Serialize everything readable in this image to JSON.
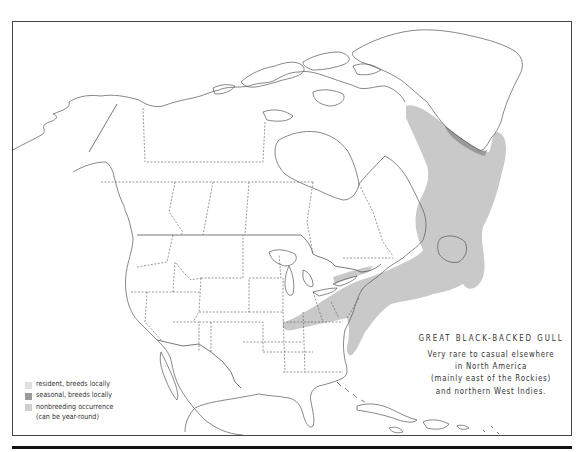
{
  "map": {
    "species_title": "GREAT BLACK-BACKED GULL",
    "note_lines": [
      "Very rare to casual elsewhere",
      "in North America",
      "(mainly east of the Rockies)",
      "and northern West Indies."
    ],
    "region": "North America",
    "colors": {
      "resident": "#e3e3e3",
      "seasonal": "#9a9a9a",
      "nonbreeding": "#c8c8c8",
      "outline": "#555555",
      "frame": "#444444"
    }
  },
  "legend": {
    "items": [
      {
        "label": "resident, breeds locally",
        "color": "#e0e0e0"
      },
      {
        "label": "seasonal, breeds locally",
        "color": "#9a9a9a"
      },
      {
        "label": "nonbreeding occurrence",
        "label2": "(can be year-round)",
        "color": "#cfcfcf"
      }
    ]
  }
}
